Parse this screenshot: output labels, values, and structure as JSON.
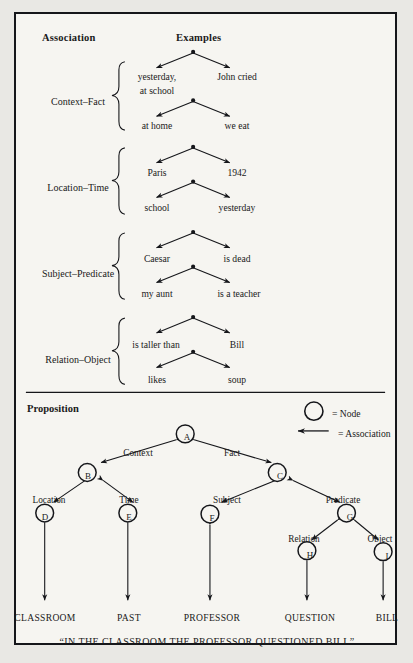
{
  "figure": {
    "background_color": "#f6f5f1",
    "border_color": "#15161a",
    "ink_color": "#15161a"
  },
  "top_section": {
    "headers": {
      "association": "Association",
      "examples": "Examples"
    },
    "rows": [
      {
        "category": "Context–Fact",
        "trees": [
          {
            "left": "yesterday,",
            "left_line2": "at school",
            "right": "John cried"
          },
          {
            "left": "at home",
            "left_line2": "",
            "right": "we eat"
          }
        ]
      },
      {
        "category": "Location–Time",
        "trees": [
          {
            "left": "Paris",
            "left_line2": "",
            "right": "1942"
          },
          {
            "left": "school",
            "left_line2": "",
            "right": "yesterday"
          }
        ]
      },
      {
        "category": "Subject–Predicate",
        "trees": [
          {
            "left": "Caesar",
            "left_line2": "",
            "right": "is dead"
          },
          {
            "left": "my aunt",
            "left_line2": "",
            "right": "is a teacher"
          }
        ]
      },
      {
        "category": "Relation–Object",
        "trees": [
          {
            "left": "is taller than",
            "left_line2": "",
            "right": "Bill"
          },
          {
            "left": "likes",
            "left_line2": "",
            "right": "soup"
          }
        ]
      }
    ]
  },
  "bottom_section": {
    "title": "Proposition",
    "legend": [
      {
        "symbol": "circle",
        "text": "= Node"
      },
      {
        "symbol": "arrow",
        "text": "= Association"
      }
    ],
    "nodes": [
      {
        "id": "A",
        "label": "A"
      },
      {
        "id": "B",
        "label": "B"
      },
      {
        "id": "C",
        "label": "C"
      },
      {
        "id": "D",
        "label": "D"
      },
      {
        "id": "E",
        "label": "E"
      },
      {
        "id": "F",
        "label": "F"
      },
      {
        "id": "G",
        "label": "G"
      },
      {
        "id": "H",
        "label": "H"
      },
      {
        "id": "I",
        "label": "I"
      }
    ],
    "edge_labels": [
      {
        "id": "context",
        "text": "Context"
      },
      {
        "id": "fact",
        "text": "Fact"
      },
      {
        "id": "location",
        "text": "Location"
      },
      {
        "id": "time",
        "text": "Time"
      },
      {
        "id": "subject",
        "text": "Subject"
      },
      {
        "id": "predicate",
        "text": "Predicate"
      },
      {
        "id": "relation",
        "text": "Relation"
      },
      {
        "id": "object",
        "text": "Object"
      }
    ],
    "terminals": [
      {
        "id": "classroom",
        "text": "CLASSROOM"
      },
      {
        "id": "past",
        "text": "PAST"
      },
      {
        "id": "professor",
        "text": "PROFESSOR"
      },
      {
        "id": "question",
        "text": "QUESTION"
      },
      {
        "id": "bill",
        "text": "BILL"
      }
    ],
    "caption": "“IN THE CLASSROOM THE PROFESSOR QUESTIONED BILL”"
  }
}
